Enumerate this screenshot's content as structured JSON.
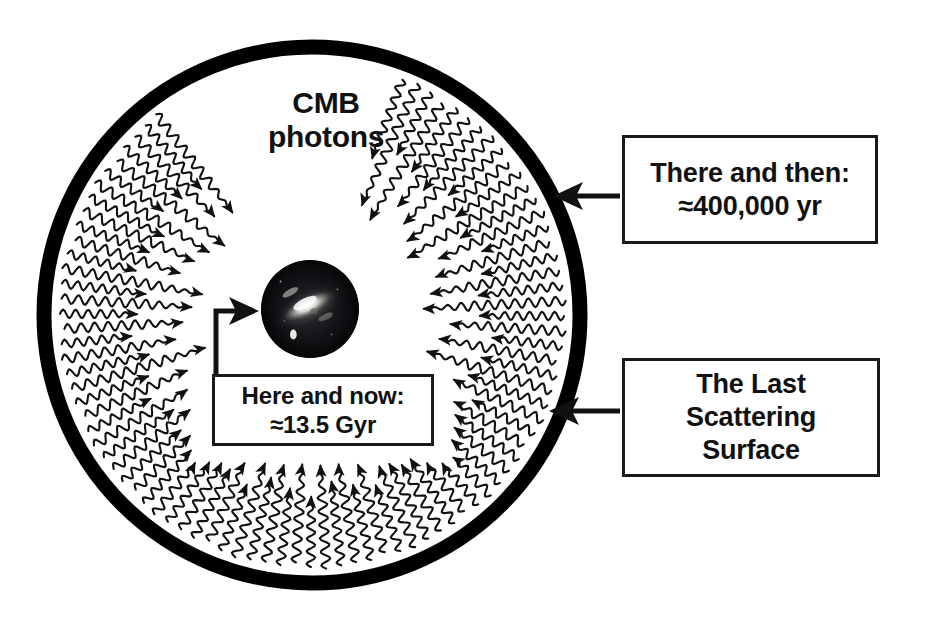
{
  "diagram": {
    "title_text": "CMB photons diagram",
    "center_label": {
      "line1": "CMB",
      "line2": "photons"
    },
    "colors": {
      "ink": "#111111",
      "ring": "#000000",
      "background": "#ffffff",
      "galaxy_dark": "#0b0b0e",
      "galaxy_bright": "#f2f2ee"
    },
    "geometry": {
      "circle_center_x": 312,
      "circle_center_y": 315,
      "circle_radius": 268,
      "ring_thickness": 15,
      "galaxy_radius": 49,
      "photon_ray_count": 52
    },
    "callouts": [
      {
        "id": "there-and-then",
        "lines": [
          "There and then:",
          "≈400,000 yr"
        ],
        "arrow_target": "last-scattering-ring-upper"
      },
      {
        "id": "the-last-scattering-surface",
        "lines": [
          "The Last",
          "Scattering",
          "Surface"
        ],
        "arrow_target": "last-scattering-ring-lower"
      },
      {
        "id": "here-and-now",
        "lines": [
          "Here and now:",
          "≈13.5 Gyr"
        ],
        "arrow_target": "galaxy"
      }
    ],
    "galaxy": {
      "name": "spiral-galaxy-thumbnail",
      "alt": "Photographic thumbnail of a bright spiral galaxy on a dark sky"
    },
    "photons": {
      "label": "CMB photons",
      "direction": "inward, from the last scattering surface toward the observer",
      "style": "wavy lines with arrowheads"
    }
  }
}
